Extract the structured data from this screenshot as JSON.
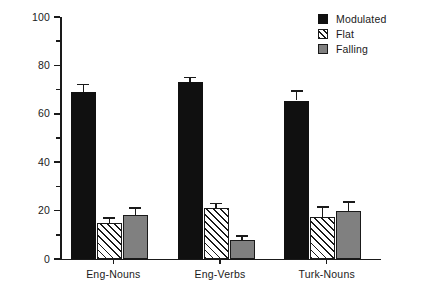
{
  "chart_data": {
    "type": "bar",
    "title": "",
    "xlabel": "",
    "ylabel": "Percent",
    "ylim": [
      0,
      100
    ],
    "ytick_major": [
      0,
      20,
      40,
      60,
      80,
      100
    ],
    "ytick_minor": [
      10,
      30,
      50,
      70,
      90
    ],
    "grid": false,
    "legend_position": "top-right",
    "categories": [
      "Eng-Nouns",
      "Eng-Verbs",
      "Turk-Nouns"
    ],
    "series": [
      {
        "name": "Modulated",
        "color": "#101010",
        "fill": "solid-black",
        "values": [
          69,
          73,
          65.5
        ],
        "errors": [
          3.0,
          2.0,
          4.0
        ]
      },
      {
        "name": "Flat",
        "color": "#ffffff",
        "fill": "diagonal-hatch",
        "values": [
          15,
          21,
          17.5
        ],
        "errors": [
          2.0,
          2.0,
          4.0
        ]
      },
      {
        "name": "Falling",
        "color": "#808080",
        "fill": "solid-gray",
        "values": [
          18,
          8,
          20
        ],
        "errors": [
          3.0,
          1.5,
          3.5
        ]
      }
    ]
  },
  "axis": {
    "y_label": "Percent",
    "y_ticks": [
      "0",
      "20",
      "40",
      "60",
      "80",
      "100"
    ],
    "x_ticks": [
      "Eng-Nouns",
      "Eng-Verbs",
      "Turk-Nouns"
    ]
  },
  "legend": {
    "items": [
      {
        "label": "Modulated",
        "swatch": "solid-black-swatch"
      },
      {
        "label": "Flat",
        "swatch": "hatched-swatch"
      },
      {
        "label": "Falling",
        "swatch": "solid-gray-swatch"
      }
    ]
  }
}
